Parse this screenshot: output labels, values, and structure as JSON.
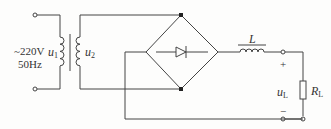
{
  "diagram": {
    "type": "bridge-rectifier-with-LC-filter",
    "source": {
      "line1": "~220V",
      "line2": "50Hz"
    },
    "primary": {
      "symbol": "u",
      "sub": "1"
    },
    "secondary": {
      "symbol": "u",
      "sub": "2"
    },
    "inductor": {
      "label": "L"
    },
    "output": {
      "plus": "+",
      "minus": "−",
      "voltage_symbol": "u",
      "voltage_sub": "L"
    },
    "load": {
      "symbol": "R",
      "sub": "L"
    },
    "colors": {
      "wire": "#444444",
      "text": "#333333"
    }
  }
}
